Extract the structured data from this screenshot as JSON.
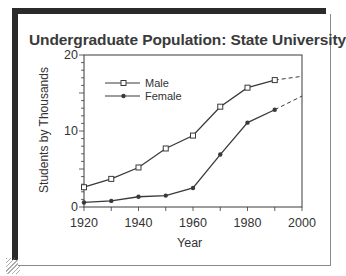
{
  "chart_data": {
    "type": "line",
    "title": "Undergraduate Population: State University",
    "xlabel": "Year",
    "ylabel": "Students by Thousands",
    "xlim": [
      1920,
      2000
    ],
    "ylim": [
      0,
      20
    ],
    "x_ticks": [
      "1920",
      "1940",
      "1960",
      "1980",
      "2000"
    ],
    "y_ticks": [
      "0",
      "10",
      "20"
    ],
    "grid": false,
    "legend_position": "upper-left inside plot",
    "x": [
      1920,
      1930,
      1940,
      1950,
      1960,
      1970,
      1980,
      1990
    ],
    "series": [
      {
        "name": "Male",
        "marker": "open-square",
        "values": [
          2.6,
          3.7,
          5.2,
          7.7,
          9.4,
          13.2,
          15.7,
          16.7
        ],
        "projection": {
          "x": [
            1990,
            2000
          ],
          "values": [
            16.7,
            17.2
          ],
          "style": "dashed"
        }
      },
      {
        "name": "Female",
        "marker": "filled-diamond",
        "values": [
          0.6,
          0.8,
          1.35,
          1.5,
          2.5,
          6.9,
          11.1,
          12.8
        ],
        "projection": {
          "x": [
            1990,
            2000
          ],
          "values": [
            12.8,
            14.6
          ],
          "style": "dashed"
        }
      }
    ]
  },
  "legend": {
    "male": "Male",
    "female": "Female"
  },
  "colors": {
    "line": "#3a3a3a",
    "shadow": "#2a2a2a",
    "border": "#8a8a8a"
  }
}
